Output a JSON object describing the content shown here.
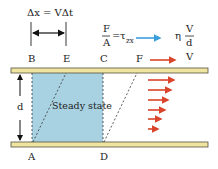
{
  "title_formula": "Δx = VΔt",
  "stress_formula": {
    "numerator": "F",
    "denominator": "A",
    "equals": "=",
    "tau": "τ",
    "tau_sub": "zx",
    "result_coeff": "η",
    "result_num": "V",
    "result_den": "d"
  },
  "plate_velocity_label": "V",
  "points": {
    "A": "A",
    "B": "B",
    "C": "C",
    "D": "D",
    "E": "E",
    "F": "F"
  },
  "gap_label": "d",
  "region_label": "Steady state",
  "colors": {
    "plate": "#efe4a0",
    "plate_border": "#555040",
    "fluid": "#a8d2e2",
    "arrow_red": "#d9442a",
    "arrow_blue": "#3aa0dc"
  }
}
